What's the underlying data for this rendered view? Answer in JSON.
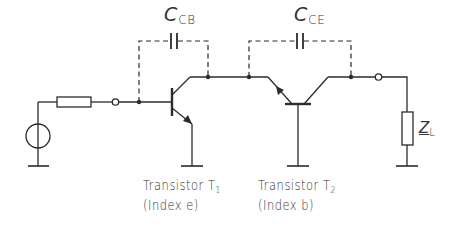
{
  "capacitors": {
    "ccb": {
      "symbol": "C",
      "subscript": "CB"
    },
    "cce": {
      "symbol": "C",
      "subscript": "CE"
    }
  },
  "transistors": {
    "t1": {
      "line1": "Transistor T",
      "subscript": "1",
      "line2": "(Index e)"
    },
    "t2": {
      "line1": "Transistor T",
      "subscript": "2",
      "line2": "(Index b)"
    }
  },
  "load": {
    "symbol": "Z",
    "subscript": "L"
  },
  "colors": {
    "line": "#2b2b2b",
    "background": "#ffffff"
  }
}
